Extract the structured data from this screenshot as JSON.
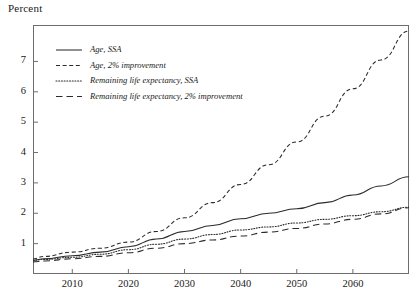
{
  "chart_data": {
    "type": "line",
    "title": "",
    "xlabel": "",
    "ylabel": "Percent",
    "xlim": [
      2003,
      2070
    ],
    "ylim": [
      0,
      8.2
    ],
    "grid": false,
    "legend_position": "upper-left",
    "xticks": [
      2010,
      2020,
      2030,
      2040,
      2050,
      2060
    ],
    "xtick_labels": [
      "2010",
      "2020",
      "2030",
      "2040",
      "2050",
      "2060"
    ],
    "yticks": [
      1,
      2,
      3,
      4,
      5,
      6,
      7
    ],
    "ytick_labels": [
      "1",
      "2",
      "3",
      "4",
      "5",
      "6",
      "7"
    ],
    "x": [
      2003,
      2005,
      2010,
      2015,
      2020,
      2025,
      2030,
      2035,
      2040,
      2045,
      2050,
      2055,
      2060,
      2065,
      2070
    ],
    "series": [
      {
        "name": "Age, SSA",
        "style": "solid",
        "values": [
          0.45,
          0.5,
          0.6,
          0.72,
          0.9,
          1.15,
          1.4,
          1.6,
          1.82,
          2.0,
          2.15,
          2.35,
          2.6,
          2.9,
          3.2
        ]
      },
      {
        "name": "Age, 2% improvement",
        "style": "dashed",
        "values": [
          0.5,
          0.58,
          0.72,
          0.85,
          1.05,
          1.4,
          1.85,
          2.35,
          2.95,
          3.6,
          4.35,
          5.2,
          6.1,
          7.05,
          8.0
        ]
      },
      {
        "name": "Remaining life expectancy, SSA",
        "style": "dotted",
        "values": [
          0.45,
          0.48,
          0.55,
          0.65,
          0.8,
          0.98,
          1.15,
          1.3,
          1.45,
          1.55,
          1.68,
          1.8,
          1.92,
          2.05,
          2.2
        ]
      },
      {
        "name": "Remaining life expectancy, 2% improvement",
        "style": "longdash",
        "values": [
          0.4,
          0.43,
          0.5,
          0.58,
          0.7,
          0.85,
          1.0,
          1.12,
          1.25,
          1.38,
          1.5,
          1.65,
          1.8,
          1.98,
          2.18
        ]
      }
    ]
  },
  "axis": {
    "ylabel": "Percent"
  },
  "legend": {
    "items": [
      {
        "label": "Age, SSA",
        "style": "solid"
      },
      {
        "label": "Age, 2% improvement",
        "style": "dashed"
      },
      {
        "label": "Remaining life expectancy, SSA",
        "style": "dotted"
      },
      {
        "label": "Remaining life expectancy, 2% improvement",
        "style": "longdash"
      }
    ]
  },
  "colors": {
    "line": "#2b2b2b",
    "axis": "#6d6d6d",
    "text": "#1a1a1a"
  }
}
